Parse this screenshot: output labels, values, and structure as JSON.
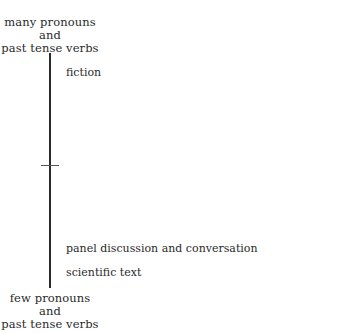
{
  "diagram": {
    "type": "vertical-scale",
    "top_label": {
      "line1": "many pronouns",
      "line2": "and",
      "line3": "past tense verbs"
    },
    "bottom_label": {
      "line1": "few pronouns",
      "line2": "and",
      "line3": "past tense verbs"
    },
    "items": [
      {
        "label": "fiction",
        "y": 66
      },
      {
        "label": "panel discussion and conversation",
        "y": 242
      },
      {
        "label": "scientific text",
        "y": 266
      }
    ],
    "midpoint_tick": true
  }
}
